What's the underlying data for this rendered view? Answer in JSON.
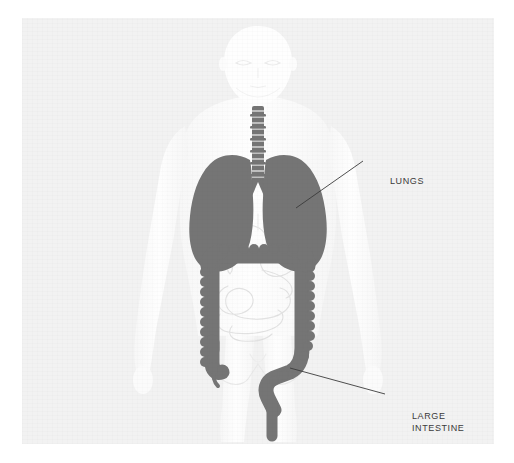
{
  "diagram": {
    "background_color": "#f2f2f2",
    "page_color": "#ffffff",
    "body_color": "#fdfdfd",
    "organ_highlight_color": "#757575",
    "faint_organ_outline_color": "#e4e4e4",
    "leader_line_color": "#3b3b3b",
    "label_text_color": "#3b3b3b"
  },
  "watermark": {
    "text": ""
  },
  "labels": [
    {
      "id": "lungs",
      "text": "LUNGS",
      "x": 368,
      "y": 157,
      "leader_from_x": 296,
      "leader_from_y": 207,
      "leader_to_x": 363,
      "leader_to_y": 161
    },
    {
      "id": "large-intestine",
      "text": "LARGE\nINTESTINE",
      "x": 390,
      "y": 392,
      "leader_from_x": 290,
      "leader_from_y": 368,
      "leader_to_x": 385,
      "leader_to_y": 394
    }
  ],
  "organs": {
    "highlighted": [
      {
        "name": "lungs",
        "color": "#757575"
      },
      {
        "name": "trachea",
        "color": "#757575"
      },
      {
        "name": "large-intestine",
        "color": "#757575"
      }
    ],
    "faint": [
      {
        "name": "liver",
        "color": "#e8e8e8"
      },
      {
        "name": "stomach",
        "color": "#e8e8e8"
      },
      {
        "name": "small-intestine",
        "color": "#e8e8e8"
      },
      {
        "name": "pelvis",
        "color": "#ededed"
      }
    ]
  },
  "body": {
    "parts": [
      "head",
      "neck",
      "torso",
      "left-arm",
      "right-arm",
      "left-leg",
      "right-leg"
    ]
  }
}
